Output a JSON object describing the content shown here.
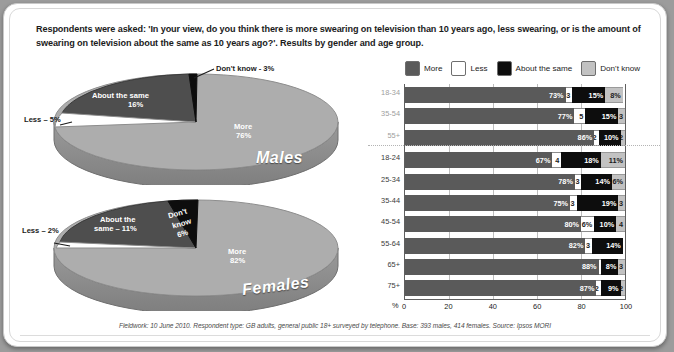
{
  "intro": "Respondents were asked: 'In your view, do you think there is more swearing on television than 10 years ago, less swearing, or is the amount of swearing on television about the same as 10 years ago?'. Results by gender and age group.",
  "footnote": "Fieldwork: 10 June 2010. Respondent type: GB adults, general public 18+ surveyed by telephone. Base: 393 males, 414 females. Source: Ipsos MORI",
  "legend": {
    "items": [
      {
        "label": "More",
        "color": "#5a5a5a",
        "icon": "legend-swatch-more"
      },
      {
        "label": "Less",
        "color": "#ffffff",
        "icon": "legend-swatch-less"
      },
      {
        "label": "About the same",
        "color": "#0d0d0d",
        "icon": "legend-swatch-about-the-same"
      },
      {
        "label": "Don't know",
        "color": "#c2c2c2",
        "icon": "legend-swatch-dont-know"
      }
    ]
  },
  "chart_data": [
    {
      "type": "pie",
      "title": "Males",
      "labels": [
        "More",
        "Less",
        "About the same",
        "Don't know"
      ],
      "values": [
        76,
        5,
        16,
        3
      ],
      "colors": [
        "#a8a8a8",
        "#ffffff",
        "#4a4a4a",
        "#0d0d0d"
      ],
      "annotations": [
        {
          "text": "More",
          "value": "76%"
        },
        {
          "text": "Less – 5%"
        },
        {
          "text": "About the same",
          "value": "16%"
        },
        {
          "text": "Don't know - 3%"
        }
      ]
    },
    {
      "type": "pie",
      "title": "Females",
      "labels": [
        "More",
        "Less",
        "About the same",
        "Don't know"
      ],
      "values": [
        82,
        2,
        11,
        6
      ],
      "colors": [
        "#a8a8a8",
        "#ffffff",
        "#4a4a4a",
        "#0d0d0d"
      ],
      "annotations": [
        {
          "text": "More",
          "value": "82%"
        },
        {
          "text": "Less – 2%"
        },
        {
          "text": "About the",
          "value": "same – 11%"
        },
        {
          "text": "Don't",
          "value": "know",
          "value2": "6%"
        }
      ]
    },
    {
      "type": "bar",
      "orientation": "horizontal",
      "stacked": true,
      "title": "",
      "xlabel": "%",
      "ylabel": "",
      "xlim": [
        0,
        100
      ],
      "xticks": [
        0,
        20,
        40,
        60,
        80,
        100
      ],
      "grid": true,
      "legend_position": "top",
      "categories": [
        "18-34",
        "35-54",
        "55+",
        "18-24",
        "25-34",
        "35-44",
        "45-54",
        "55-64",
        "65+",
        "75+"
      ],
      "series": [
        {
          "name": "More",
          "color": "#5a5a5a",
          "values": [
            73,
            77,
            86,
            67,
            78,
            75,
            80,
            82,
            88,
            87
          ]
        },
        {
          "name": "Less",
          "color": "#ffffff",
          "values": [
            3,
            5,
            2,
            4,
            3,
            3,
            6,
            3,
            1,
            2
          ]
        },
        {
          "name": "About the same",
          "color": "#0d0d0d",
          "values": [
            15,
            15,
            10,
            18,
            14,
            19,
            10,
            14,
            8,
            9
          ]
        },
        {
          "name": "Don't know",
          "color": "#c2c2c2",
          "values": [
            8,
            3,
            2,
            11,
            6,
            3,
            4,
            0,
            3,
            2
          ]
        }
      ],
      "data_labels": [
        {
          "category": "18-34",
          "more": "73%",
          "less": "3",
          "same": "15%",
          "dk": "8%"
        },
        {
          "category": "35-54",
          "more": "77%",
          "less": "5",
          "same": "15%",
          "dk": "3"
        },
        {
          "category": "55+",
          "more": "86%",
          "less": "2",
          "same": "10%",
          "dk": "2"
        },
        {
          "category": "18-24",
          "more": "67%",
          "less": "4",
          "same": "18%",
          "dk": "11%"
        },
        {
          "category": "25-34",
          "more": "78%",
          "less": "3",
          "same": "14%",
          "dk": "6%"
        },
        {
          "category": "35-44",
          "more": "75%",
          "less": "3",
          "same": "19%",
          "dk": "3"
        },
        {
          "category": "45-54",
          "more": "80%",
          "less": "6%",
          "same": "10%",
          "dk": "4"
        },
        {
          "category": "55-64",
          "more": "82%",
          "less": "3",
          "same": "14%",
          "dk": ""
        },
        {
          "category": "65+",
          "more": "88%",
          "less": "",
          "same": "8%",
          "dk": "3"
        },
        {
          "category": "75+",
          "more": "87%",
          "less": "2",
          "same": "9%",
          "dk": "2"
        }
      ]
    }
  ],
  "males_pie": {
    "title": "Males",
    "more_label": "More",
    "more_value": "76%",
    "less_label": "Less – 5%",
    "same_label": "About the same",
    "same_value": "16%",
    "dk_label": "Don't know - 3%"
  },
  "females_pie": {
    "title": "Females",
    "more_label": "More",
    "more_value": "82%",
    "less_label": "Less – 2%",
    "same_label_1": "About the",
    "same_label_2": "same – 11%",
    "dk_label_1": "Don't",
    "dk_label_2": "know",
    "dk_value": "6%"
  },
  "axis": {
    "pct_symbol": "%",
    "ticks": [
      "0",
      "20",
      "40",
      "60",
      "80",
      "100"
    ]
  }
}
